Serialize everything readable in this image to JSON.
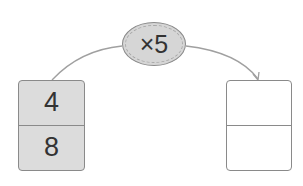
{
  "operator": {
    "label": "×5"
  },
  "input_box": {
    "top": "4",
    "bottom": "8"
  },
  "output_box": {
    "top": "",
    "bottom": ""
  },
  "colors": {
    "filled": "#dcdcdc",
    "stroke": "#8a8a8a",
    "arrow": "#a0a0a0"
  }
}
